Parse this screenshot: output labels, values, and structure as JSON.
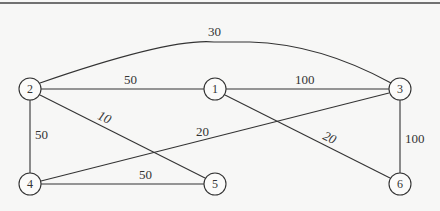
{
  "graph": {
    "nodes": [
      {
        "id": "1",
        "x": 215,
        "y": 89
      },
      {
        "id": "2",
        "x": 30,
        "y": 89
      },
      {
        "id": "3",
        "x": 400,
        "y": 89
      },
      {
        "id": "4",
        "x": 30,
        "y": 184
      },
      {
        "id": "5",
        "x": 215,
        "y": 184
      },
      {
        "id": "6",
        "x": 400,
        "y": 184
      }
    ],
    "edges": [
      {
        "from": "2",
        "to": "3",
        "weight": "30",
        "curved": true
      },
      {
        "from": "2",
        "to": "1",
        "weight": "50"
      },
      {
        "from": "1",
        "to": "3",
        "weight": "100"
      },
      {
        "from": "2",
        "to": "5",
        "weight": "10"
      },
      {
        "from": "4",
        "to": "3",
        "weight": "20"
      },
      {
        "from": "1",
        "to": "6",
        "weight": "20"
      },
      {
        "from": "2",
        "to": "4",
        "weight": "50"
      },
      {
        "from": "4",
        "to": "5",
        "weight": "50"
      },
      {
        "from": "3",
        "to": "6",
        "weight": "100"
      }
    ]
  }
}
